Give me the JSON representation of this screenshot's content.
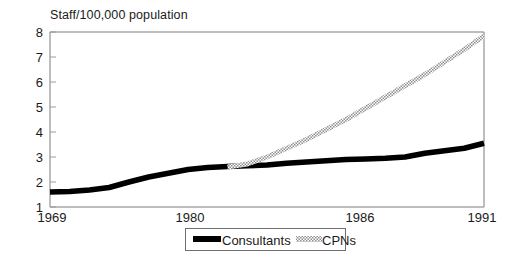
{
  "chart_data": {
    "type": "line",
    "title": "Staff/100,000 population",
    "xlabel": "",
    "ylabel": "Staff/100,000 population",
    "xlim": [
      1969,
      1991
    ],
    "ylim": [
      1,
      8
    ],
    "grid": false,
    "legend_position": "bottom",
    "xticks": [
      {
        "value": 1969,
        "label": "1969"
      },
      {
        "value": 1980,
        "label": "1980"
      },
      {
        "value": 1986,
        "label": "1986"
      },
      {
        "value": 1991,
        "label": "1991"
      }
    ],
    "yticks": [
      {
        "value": 1,
        "label": "1"
      },
      {
        "value": 2,
        "label": "2"
      },
      {
        "value": 3,
        "label": "3"
      },
      {
        "value": 4,
        "label": "4"
      },
      {
        "value": 5,
        "label": "5"
      },
      {
        "value": 6,
        "label": "6"
      },
      {
        "value": 7,
        "label": "7"
      },
      {
        "value": 8,
        "label": "8"
      }
    ],
    "series": [
      {
        "name": "Consultants",
        "style": "solid-thick-black",
        "color": "#000000",
        "x": [
          1969,
          1970,
          1971,
          1972,
          1973,
          1974,
          1975,
          1976,
          1977,
          1978,
          1979,
          1980,
          1981,
          1982,
          1983,
          1984,
          1985,
          1986,
          1987,
          1988,
          1989,
          1990,
          1991
        ],
        "values": [
          1.6,
          1.62,
          1.68,
          1.78,
          2.0,
          2.2,
          2.35,
          2.5,
          2.58,
          2.62,
          2.65,
          2.68,
          2.75,
          2.8,
          2.85,
          2.9,
          2.92,
          2.95,
          3.0,
          3.15,
          3.25,
          3.35,
          3.55
        ]
      },
      {
        "name": "CPNs",
        "style": "hatched-grey",
        "color": "#9c9c9c",
        "x": [
          1978,
          1979,
          1980,
          1981,
          1982,
          1983,
          1984,
          1985,
          1986,
          1987,
          1988,
          1989,
          1990,
          1991
        ],
        "values": [
          2.6,
          2.72,
          3.0,
          3.35,
          3.7,
          4.1,
          4.5,
          4.95,
          5.4,
          5.85,
          6.3,
          6.8,
          7.3,
          7.85
        ]
      }
    ]
  },
  "legend": {
    "items": [
      {
        "label": "Consultants",
        "swatch": "solid-thick-black"
      },
      {
        "label": "CPNs",
        "swatch": "hatched-grey"
      }
    ]
  },
  "colors": {
    "consultants": "#000000",
    "cpns": "#9c9c9c",
    "axis": "#7d7d7d",
    "text": "#1a1a1a",
    "background": "#ffffff"
  }
}
